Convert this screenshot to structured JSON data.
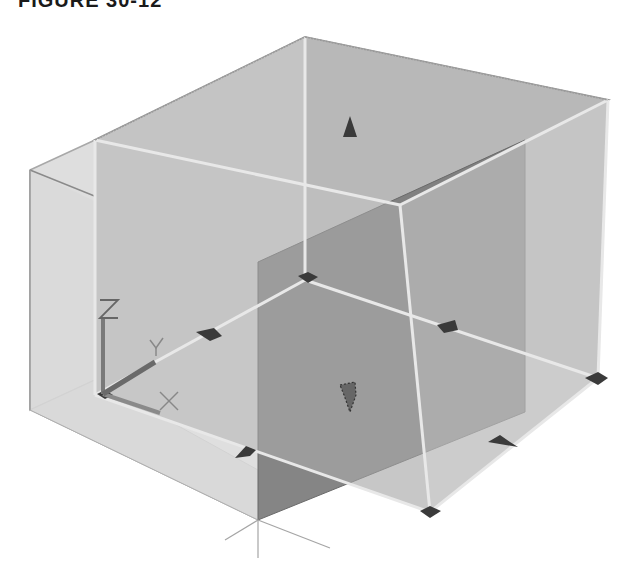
{
  "figure": {
    "caption": "FIGURE 30-12",
    "colors": {
      "background": "#ffffff",
      "box_face_light": "#c9c9c9",
      "box_face_mid": "#b3b3b3",
      "side_box": "#dcdcdc",
      "section_plane": "#7d7d7d",
      "edge": "#e6e6e6",
      "edge_dark": "#8a8a8a",
      "grip": "#3a3a3a"
    },
    "ucs_icon": {
      "x_label": "X",
      "y_label": "Y",
      "z_label": "Z"
    },
    "grips": [
      {
        "name": "top-arrow-grip",
        "shape": "triangle"
      },
      {
        "name": "center-arrow-grip",
        "shape": "arrow-down"
      },
      {
        "name": "back-corner-grip",
        "shape": "diamond"
      },
      {
        "name": "left-edge-grip",
        "shape": "arrow"
      },
      {
        "name": "right-inner-grip",
        "shape": "arrow"
      },
      {
        "name": "front-left-grip",
        "shape": "arrow"
      },
      {
        "name": "front-right-grip",
        "shape": "arrow"
      },
      {
        "name": "right-corner-grip",
        "shape": "diamond"
      },
      {
        "name": "front-corner-grip",
        "shape": "diamond"
      },
      {
        "name": "origin-grip",
        "shape": "diamond"
      }
    ]
  }
}
